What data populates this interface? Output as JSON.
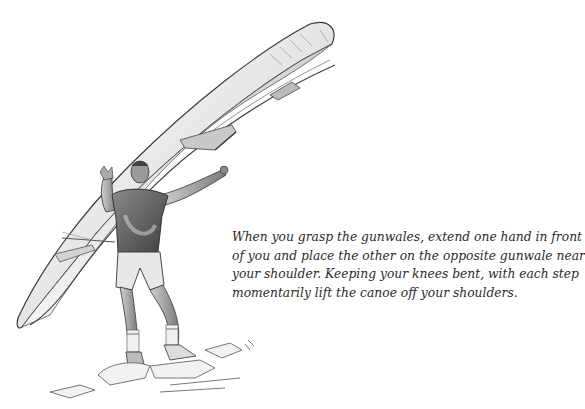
{
  "illustration": {
    "subject": "man-carrying-canoe-overhead",
    "style": "pencil-sketch",
    "colors": {
      "ink": "#3a3a3a",
      "shade": "#8a8a8a",
      "light": "#d8d8d8",
      "paper": "#ffffff"
    }
  },
  "caption": {
    "lines": [
      "When you grasp the gunwales, extend one hand in front",
      "of you and place the other on the opposite gunwale near",
      "your shoulder. Keeping your knees bent, with each step",
      "momentarily lift the canoe off your shoulders."
    ]
  }
}
